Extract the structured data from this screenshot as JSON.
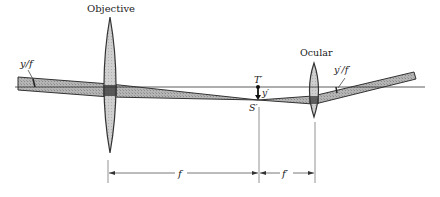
{
  "diagram": {
    "colors": {
      "background": "#ffffff",
      "line": "#333333",
      "lens_fill": "#c8c8c8",
      "beam_fill": "#a9a9a9",
      "beam_dark": "#333333"
    },
    "labels": {
      "objective": "Objective",
      "ocular": "Ocular",
      "input_angle": "y/f",
      "output_angle": "y′/f′",
      "image_top": "T′",
      "image_height": "y′",
      "image_point": "S′",
      "focal_objective": "f",
      "focal_ocular": "f′"
    },
    "elements": {
      "optical_axis": {
        "x1": 15,
        "x2": 425,
        "y": 87
      },
      "objective_lens": {
        "cx": 110,
        "top": 17,
        "bottom": 153,
        "half_width": 8
      },
      "ocular_lens": {
        "cx": 314,
        "top": 63,
        "bottom": 117,
        "half_width": 6
      },
      "focal_point": {
        "x": 258,
        "y_axis": 87,
        "y_image": 100
      }
    }
  }
}
